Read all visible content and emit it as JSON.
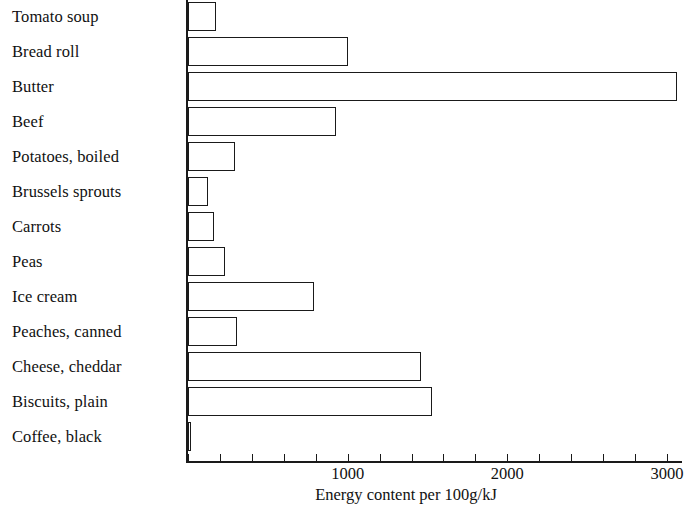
{
  "chart_data": {
    "type": "bar",
    "orientation": "horizontal",
    "title": "",
    "xlabel": "Energy content per 100g/kJ",
    "ylabel": "",
    "xlim": [
      0,
      3200
    ],
    "xticks": [
      0,
      1000,
      2000,
      3000
    ],
    "xtick_labels": [
      "",
      "1000",
      "2000",
      "3000"
    ],
    "minor_tick_step": 200,
    "grid": false,
    "legend": false,
    "categories": [
      "Tomato soup",
      "Bread roll",
      "Butter",
      "Beef",
      "Potatoes, boiled",
      "Brussels sprouts",
      "Carrots",
      "Peas",
      "Ice cream",
      "Peaches, canned",
      "Cheese, cheddar",
      "Biscuits, plain",
      "Coffee, black"
    ],
    "values": [
      175,
      1005,
      3060,
      930,
      295,
      125,
      165,
      230,
      790,
      310,
      1460,
      1530,
      20
    ],
    "bar_fill": "#ffffff",
    "bar_edge": "#1a1a1a",
    "axis_color": "#1a1a1a"
  }
}
